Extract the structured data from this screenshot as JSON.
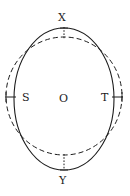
{
  "figure": {
    "background_color": "#ffffff",
    "stroke_color": "#1c1c1c",
    "labels": {
      "top": "X",
      "bottom": "Y",
      "left": "S",
      "right": "T",
      "center": "O"
    },
    "shapes": {
      "ellipse": {
        "style": "solid",
        "center_x": 64,
        "center_y": 99,
        "radius_x": 50,
        "radius_y": 71,
        "stroke_width": 1.1
      },
      "circle": {
        "style": "dashed",
        "center_x": 64,
        "center_y": 96,
        "radius_x": 58,
        "radius_y": 59,
        "stroke_width": 1.0,
        "dash_pattern": "5 3"
      }
    },
    "connectors": [
      {
        "name": "top-gap",
        "orientation": "vertical",
        "x1": 64,
        "y1": 28,
        "x2": 64,
        "y2": 38
      },
      {
        "name": "bottom-gap",
        "orientation": "vertical",
        "x1": 64,
        "y1": 155,
        "x2": 64,
        "y2": 170
      },
      {
        "name": "left-gap",
        "orientation": "horizontal",
        "x1": 6,
        "y1": 97,
        "x2": 15,
        "y2": 97
      },
      {
        "name": "right-gap",
        "orientation": "horizontal",
        "x1": 113,
        "y1": 97,
        "x2": 122,
        "y2": 97
      }
    ]
  },
  "chart_data": {
    "type": "diagram",
    "points": [
      {
        "label": "X",
        "position": "top",
        "x": 64,
        "y": 28,
        "belongs_to": "ellipse"
      },
      {
        "label": "Y",
        "position": "bottom",
        "x": 64,
        "y": 170,
        "belongs_to": "ellipse"
      },
      {
        "label": "S",
        "position": "left",
        "x": 14,
        "y": 97,
        "belongs_to": "ellipse"
      },
      {
        "label": "T",
        "position": "right",
        "x": 114,
        "y": 97,
        "belongs_to": "ellipse"
      },
      {
        "label": "O",
        "position": "center",
        "x": 64,
        "y": 99,
        "belongs_to": "both"
      }
    ],
    "series": [
      {
        "name": "ellipse",
        "style": "solid",
        "semi_major_vertical": 71,
        "semi_minor_horizontal": 50
      },
      {
        "name": "circle",
        "style": "dashed",
        "radius_horizontal": 58,
        "radius_vertical": 59
      }
    ],
    "xlabel": "",
    "ylabel": "",
    "grid": false,
    "legend": "none"
  }
}
